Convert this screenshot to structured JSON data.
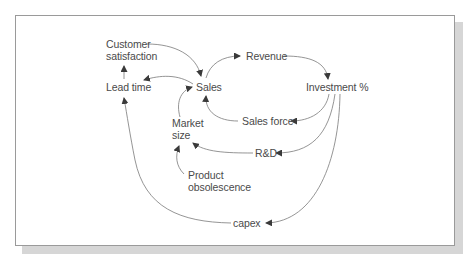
{
  "diagram": {
    "type": "causal-loop",
    "nodes": {
      "customer_satisfaction": {
        "line1": "Customer",
        "line2": "satisfaction"
      },
      "lead_time": "Lead time",
      "sales": "Sales",
      "revenue": "Revenue",
      "investment": "Investment %",
      "sales_force": "Sales force",
      "market_size": {
        "line1": "Market",
        "line2": "size"
      },
      "rnd": "R&D",
      "product_obsolescence": {
        "line1": "Product",
        "line2": "obsolescence"
      },
      "capex": "capex"
    },
    "edges": [
      {
        "from": "Customer satisfaction",
        "to": "Sales"
      },
      {
        "from": "Lead time",
        "to": "Customer satisfaction"
      },
      {
        "from": "Sales",
        "to": "Lead time"
      },
      {
        "from": "Sales",
        "to": "Revenue"
      },
      {
        "from": "Revenue",
        "to": "Investment %"
      },
      {
        "from": "Investment %",
        "to": "Sales force"
      },
      {
        "from": "Sales force",
        "to": "Sales"
      },
      {
        "from": "Market size",
        "to": "Sales"
      },
      {
        "from": "Investment %",
        "to": "R&D"
      },
      {
        "from": "R&D",
        "to": "Market size"
      },
      {
        "from": "Product obsolescence",
        "to": "Market size"
      },
      {
        "from": "Investment %",
        "to": "capex"
      },
      {
        "from": "capex",
        "to": "Lead time"
      }
    ],
    "colors": {
      "line": "#7a7a7a",
      "arrow": "#3a3a3a",
      "text": "#4a4a4a",
      "frame": "#9a9a9a",
      "shadow": "#d6d6d6"
    }
  }
}
